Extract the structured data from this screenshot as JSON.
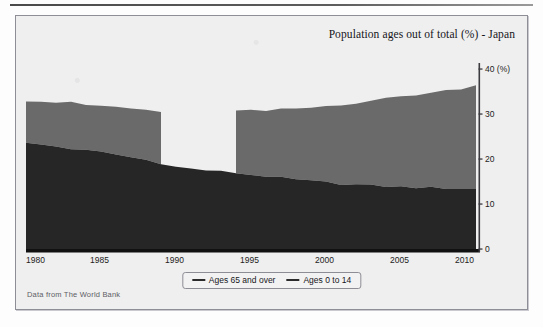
{
  "figure": {
    "title": "Population ages out of total (%) - Japan",
    "source_note": "Data from The World Bank"
  },
  "axes": {
    "y_unit_label": "40 (%)",
    "y_ticks": [
      "0",
      "10",
      "20",
      "30",
      "40 (%)"
    ],
    "x_ticks": [
      "1980",
      "1985",
      "1990",
      "1995",
      "2000",
      "2005",
      "2010"
    ]
  },
  "legend": {
    "items": [
      {
        "label": "Ages 65 and over",
        "color": "#6a6a6a"
      },
      {
        "label": "Ages 0 to 14",
        "color": "#262626"
      }
    ]
  },
  "colors": {
    "series_65_and_over": "#6a6a6a",
    "series_0_to_14": "#262626",
    "panel_background": "#efefef",
    "axis": "#111111",
    "panel_border": "#8e8e96"
  },
  "chart_data": {
    "type": "area",
    "stacked": true,
    "title": "Population ages out of total (%) - Japan",
    "xlabel": "",
    "ylabel": "",
    "ylim": [
      0,
      40
    ],
    "xlim": [
      1980,
      2010
    ],
    "grid": false,
    "legend_position": "bottom",
    "x": [
      1980,
      1981,
      1982,
      1983,
      1984,
      1985,
      1986,
      1987,
      1988,
      1989,
      1990,
      1991,
      1992,
      1993,
      1994,
      1995,
      1996,
      1997,
      1998,
      1999,
      2000,
      2001,
      2002,
      2003,
      2004,
      2005,
      2006,
      2007,
      2008,
      2009,
      2010
    ],
    "series": [
      {
        "name": "Ages 0 to 14",
        "values": [
          23.5,
          23.2,
          22.8,
          22.3,
          21.9,
          21.5,
          21.0,
          20.4,
          19.8,
          19.1,
          18.2,
          17.8,
          17.5,
          17.2,
          16.9,
          16.5,
          16.2,
          15.8,
          15.4,
          15.1,
          14.8,
          14.5,
          14.3,
          14.1,
          13.9,
          13.8,
          13.7,
          13.6,
          13.5,
          13.4,
          13.3
        ]
      },
      {
        "name": "Ages 65 and over",
        "values": [
          9.5,
          9.6,
          9.8,
          10.2,
          10.1,
          10.3,
          10.6,
          10.8,
          11.1,
          11.4,
          null,
          null,
          null,
          null,
          13.8,
          14.2,
          14.5,
          15.2,
          15.8,
          16.3,
          17.0,
          17.6,
          18.2,
          18.9,
          19.5,
          20.1,
          20.6,
          21.1,
          21.7,
          22.3,
          23.0
        ]
      }
    ]
  }
}
